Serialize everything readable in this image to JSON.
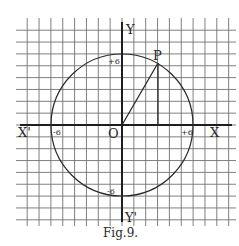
{
  "figure": {
    "caption": "Fig.9.",
    "grid": {
      "unit_px": 11.85,
      "origin_px": [
        122,
        125
      ],
      "x_lines": 18,
      "y_lines": 16
    },
    "axes": {
      "x_pos_label": "X",
      "x_neg_label": "X'",
      "y_pos_label": "Y",
      "y_neg_label": "Y'",
      "origin_label": "O"
    },
    "circle": {
      "center": [
        0,
        0
      ],
      "radius": 6
    },
    "ticks": {
      "x_pos": "+6",
      "x_neg": "-6",
      "y_pos": "+6",
      "y_neg": "-6"
    },
    "point": {
      "label": "P",
      "x": 3,
      "y": 5.2,
      "angle_deg": 60
    },
    "colors": {
      "ink": "#2a2a2a",
      "grid": "#555555",
      "paper": "#ffffff"
    }
  }
}
